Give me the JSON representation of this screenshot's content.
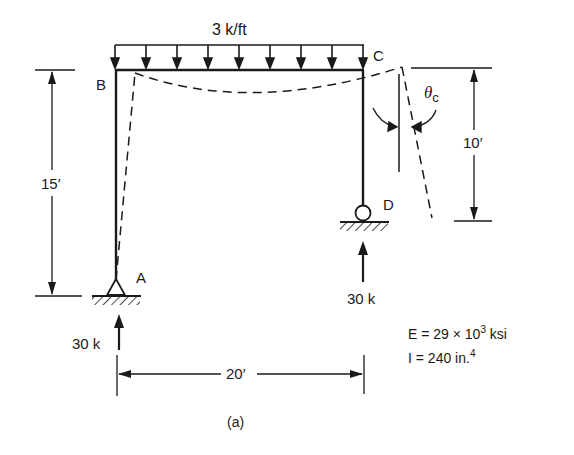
{
  "diagram": {
    "type": "structural-frame",
    "caption": "(a)",
    "load": {
      "label": "3 k/ft",
      "type": "uniform-distributed",
      "arrow_count": 9
    },
    "nodes": [
      {
        "id": "A",
        "label": "A",
        "support": "pin"
      },
      {
        "id": "B",
        "label": "B",
        "support": "none"
      },
      {
        "id": "C",
        "label": "C",
        "support": "none"
      },
      {
        "id": "D",
        "label": "D",
        "support": "roller"
      }
    ],
    "members": [
      {
        "from": "A",
        "to": "B",
        "orientation": "vertical"
      },
      {
        "from": "B",
        "to": "C",
        "orientation": "horizontal"
      },
      {
        "from": "C",
        "to": "D",
        "orientation": "vertical"
      }
    ],
    "dimensions": {
      "left_height": "15′",
      "right_height": "10′",
      "span": "20′"
    },
    "reactions": {
      "A": "30 k",
      "D": "30 k"
    },
    "rotation_label": {
      "symbol": "θ",
      "subscript": "c"
    },
    "properties": {
      "E_prefix": "E = 29 × 10",
      "E_exp": "3",
      "E_unit": " ksi",
      "I_prefix": "I = 240 in.",
      "I_exp": "4"
    }
  }
}
